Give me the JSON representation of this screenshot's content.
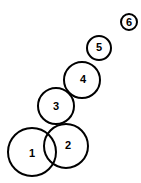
{
  "diagram": {
    "type": "numbered-circles",
    "stroke_color": "#000000",
    "background": "#ffffff",
    "circles": [
      {
        "label": "1",
        "cx": 32,
        "cy": 152,
        "r": 24
      },
      {
        "label": "2",
        "cx": 66,
        "cy": 146,
        "r": 22
      },
      {
        "label": "3",
        "cx": 56,
        "cy": 106,
        "r": 18
      },
      {
        "label": "4",
        "cx": 82,
        "cy": 80,
        "r": 18
      },
      {
        "label": "5",
        "cx": 99,
        "cy": 48,
        "r": 12
      },
      {
        "label": "6",
        "cx": 129,
        "cy": 22,
        "r": 8
      }
    ]
  }
}
